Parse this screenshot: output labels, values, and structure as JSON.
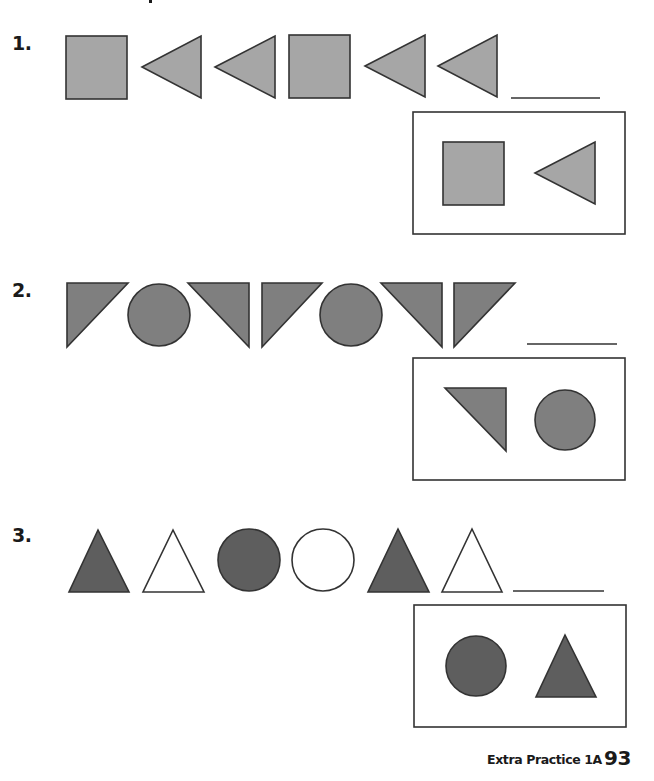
{
  "page": {
    "footer_label": "Extra Practice 1A",
    "page_number": "93"
  },
  "colors": {
    "row1_fill": "#a6a6a6",
    "row2_fill": "#7f7f7f",
    "row3_fill": "#5e5e5e",
    "stroke": "#333333",
    "white": "#ffffff"
  },
  "problems": [
    {
      "number": "1.",
      "sequence": [
        "square",
        "triangle-left",
        "triangle-left",
        "square",
        "triangle-left",
        "triangle-left"
      ],
      "answer_blank": "",
      "choices": [
        "square",
        "triangle-left"
      ]
    },
    {
      "number": "2.",
      "sequence": [
        "right-triangle-down-left",
        "circle",
        "right-triangle-down-right",
        "right-triangle-down-left",
        "circle",
        "right-triangle-down-right",
        "right-triangle-down-left"
      ],
      "answer_blank": "",
      "choices": [
        "right-triangle-down-right",
        "circle"
      ]
    },
    {
      "number": "3.",
      "sequence": [
        "triangle-dark",
        "triangle-white",
        "circle-dark",
        "circle-white",
        "triangle-dark",
        "triangle-white"
      ],
      "answer_blank": "",
      "choices": [
        "circle-dark",
        "triangle-dark"
      ]
    }
  ]
}
